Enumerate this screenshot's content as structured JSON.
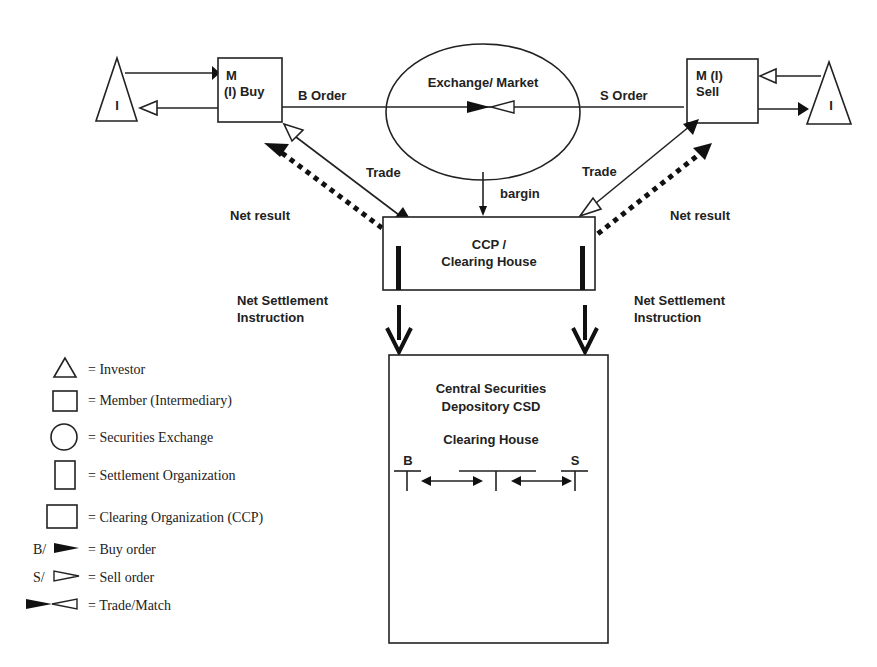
{
  "diagram": {
    "nodes": {
      "investor_left": "I",
      "investor_right": "I",
      "member_buy": {
        "line1": "M",
        "line2": "(I) Buy"
      },
      "member_sell": {
        "line1": "M (I)",
        "line2": "Sell"
      },
      "exchange": "Exchange/ Market",
      "ccp": {
        "line1": "CCP /",
        "line2": "Clearing House"
      },
      "csd": {
        "line1": "Central Securities",
        "line2": "Depository CSD",
        "sub_title": "Clearing House",
        "buy_mark": "B",
        "sell_mark": "S"
      }
    },
    "edges": {
      "b_order": "B Order",
      "s_order": "S Order",
      "trade_left": "Trade",
      "trade_right": "Trade",
      "bargin": "bargin",
      "net_result_left": "Net result",
      "net_result_right": "Net result",
      "net_settlement_left": {
        "line1": "Net Settlement",
        "line2": "Instruction"
      },
      "net_settlement_right": {
        "line1": "Net Settlement",
        "line2": "Instruction"
      }
    }
  },
  "legend": [
    {
      "symbol": "triangle",
      "label": "= Investor"
    },
    {
      "symbol": "square",
      "label": "= Member (Intermediary)"
    },
    {
      "symbol": "circle",
      "label": "= Securities Exchange"
    },
    {
      "symbol": "tall-rect",
      "label": "= Settlement Organization"
    },
    {
      "symbol": "wide-rect",
      "label": "= Clearing Organization (CCP)"
    },
    {
      "symbol": "filled-arrow",
      "prefix": "B/",
      "label": "= Buy order"
    },
    {
      "symbol": "hollow-arrow",
      "prefix": "S/",
      "label": "= Sell order"
    },
    {
      "symbol": "bowtie",
      "label": "= Trade/Match"
    }
  ]
}
